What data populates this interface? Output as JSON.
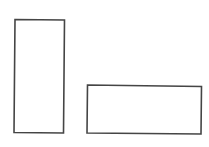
{
  "diagram": {
    "background": "#ffffff",
    "stroke_color": "#454545",
    "stroke_width": 1.6,
    "shapes": [
      {
        "id": "tall-rectangle",
        "type": "quadrilateral",
        "points": [
          [
            15,
            19.5
          ],
          [
            64.5,
            20
          ],
          [
            63.5,
            133
          ],
          [
            14,
            132.5
          ]
        ]
      },
      {
        "id": "wide-rectangle",
        "type": "quadrilateral",
        "points": [
          [
            87.5,
            85
          ],
          [
            201.5,
            86.5
          ],
          [
            201,
            134
          ],
          [
            87,
            133
          ]
        ]
      }
    ]
  }
}
